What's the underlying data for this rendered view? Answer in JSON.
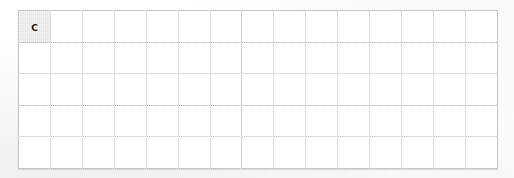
{
  "document": {
    "kind": "scanned-grid-table",
    "background_color": "#fdfdfd"
  },
  "grid": {
    "columns": 15,
    "rows": 5,
    "line_color": "#9e9e9e",
    "cell_fill": "#ffffff",
    "shaded_cell_fill": "#cfcfcf",
    "cells": [
      [
        {
          "text": "C",
          "shaded": true
        },
        {
          "text": "",
          "shaded": false
        },
        {
          "text": "",
          "shaded": false
        },
        {
          "text": "",
          "shaded": false
        },
        {
          "text": "",
          "shaded": false
        },
        {
          "text": "",
          "shaded": false
        },
        {
          "text": "",
          "shaded": false
        },
        {
          "text": "",
          "shaded": false
        },
        {
          "text": "",
          "shaded": false
        },
        {
          "text": "",
          "shaded": false
        },
        {
          "text": "",
          "shaded": false
        },
        {
          "text": "",
          "shaded": false
        },
        {
          "text": "",
          "shaded": false
        },
        {
          "text": "",
          "shaded": false
        },
        {
          "text": "",
          "shaded": false
        }
      ],
      [
        {
          "text": "",
          "shaded": false
        },
        {
          "text": "",
          "shaded": false
        },
        {
          "text": "",
          "shaded": false
        },
        {
          "text": "",
          "shaded": false
        },
        {
          "text": "",
          "shaded": false
        },
        {
          "text": "",
          "shaded": false
        },
        {
          "text": "",
          "shaded": false
        },
        {
          "text": "",
          "shaded": false
        },
        {
          "text": "",
          "shaded": false
        },
        {
          "text": "",
          "shaded": false
        },
        {
          "text": "",
          "shaded": false
        },
        {
          "text": "",
          "shaded": false
        },
        {
          "text": "",
          "shaded": false
        },
        {
          "text": "",
          "shaded": false
        },
        {
          "text": "",
          "shaded": false
        }
      ],
      [
        {
          "text": "",
          "shaded": false
        },
        {
          "text": "",
          "shaded": false
        },
        {
          "text": "",
          "shaded": false
        },
        {
          "text": "",
          "shaded": false
        },
        {
          "text": "",
          "shaded": false
        },
        {
          "text": "",
          "shaded": false
        },
        {
          "text": "",
          "shaded": false
        },
        {
          "text": "",
          "shaded": false
        },
        {
          "text": "",
          "shaded": false
        },
        {
          "text": "",
          "shaded": false
        },
        {
          "text": "",
          "shaded": false
        },
        {
          "text": "",
          "shaded": false
        },
        {
          "text": "",
          "shaded": false
        },
        {
          "text": "",
          "shaded": false
        },
        {
          "text": "",
          "shaded": false
        }
      ],
      [
        {
          "text": "",
          "shaded": false
        },
        {
          "text": "",
          "shaded": false
        },
        {
          "text": "",
          "shaded": false
        },
        {
          "text": "",
          "shaded": false
        },
        {
          "text": "",
          "shaded": false
        },
        {
          "text": "",
          "shaded": false
        },
        {
          "text": "",
          "shaded": false
        },
        {
          "text": "",
          "shaded": false
        },
        {
          "text": "",
          "shaded": false
        },
        {
          "text": "",
          "shaded": false
        },
        {
          "text": "",
          "shaded": false
        },
        {
          "text": "",
          "shaded": false
        },
        {
          "text": "",
          "shaded": false
        },
        {
          "text": "",
          "shaded": false
        },
        {
          "text": "",
          "shaded": false
        }
      ],
      [
        {
          "text": "",
          "shaded": false
        },
        {
          "text": "",
          "shaded": false
        },
        {
          "text": "",
          "shaded": false
        },
        {
          "text": "",
          "shaded": false
        },
        {
          "text": "",
          "shaded": false
        },
        {
          "text": "",
          "shaded": false
        },
        {
          "text": "",
          "shaded": false
        },
        {
          "text": "",
          "shaded": false
        },
        {
          "text": "",
          "shaded": false
        },
        {
          "text": "",
          "shaded": false
        },
        {
          "text": "",
          "shaded": false
        },
        {
          "text": "",
          "shaded": false
        },
        {
          "text": "",
          "shaded": false
        },
        {
          "text": "",
          "shaded": false
        },
        {
          "text": "",
          "shaded": false
        }
      ]
    ]
  }
}
